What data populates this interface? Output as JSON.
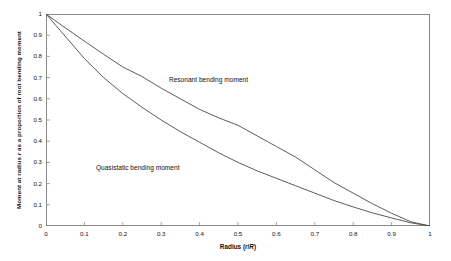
{
  "chart_data": {
    "type": "line",
    "title": "",
    "xlabel": "Radius (r/R)",
    "ylabel": "Moment at radius r as a proportion of root bending moment",
    "xlim": [
      0,
      1
    ],
    "ylim": [
      0,
      1
    ],
    "grid": false,
    "legend_position": "inline-annotations",
    "xticks": [
      "0",
      "0.1",
      "0.2",
      "0.3",
      "0.4",
      "0.5",
      "0.6",
      "0.7",
      "0.8",
      "0.9",
      "1"
    ],
    "yticks": [
      "0",
      "0.1",
      "0.2",
      "0.3",
      "0.4",
      "0.5",
      "0.6",
      "0.7",
      "0.8",
      "0.9",
      "1"
    ],
    "x": [
      0,
      0.05,
      0.1,
      0.15,
      0.2,
      0.25,
      0.3,
      0.35,
      0.4,
      0.45,
      0.5,
      0.55,
      0.6,
      0.65,
      0.7,
      0.75,
      0.8,
      0.85,
      0.9,
      0.95,
      1
    ],
    "series": [
      {
        "name": "Resonant bending moment",
        "values": [
          1.0,
          0.935,
          0.872,
          0.81,
          0.75,
          0.705,
          0.65,
          0.6,
          0.55,
          0.51,
          0.475,
          0.425,
          0.375,
          0.325,
          0.265,
          0.205,
          0.155,
          0.105,
          0.06,
          0.02,
          0.0
        ],
        "annotation": "Resonant bending moment",
        "annotation_x": 0.32,
        "annotation_y": 0.69
      },
      {
        "name": "Quasistatic bending moment",
        "values": [
          1.0,
          0.895,
          0.79,
          0.7,
          0.625,
          0.56,
          0.5,
          0.445,
          0.395,
          0.345,
          0.3,
          0.26,
          0.225,
          0.19,
          0.155,
          0.12,
          0.09,
          0.062,
          0.038,
          0.015,
          0.0
        ],
        "annotation": "Quasistatic bending moment",
        "annotation_x": 0.13,
        "annotation_y": 0.275
      }
    ],
    "colors": {
      "curve": "#4a4a4a",
      "axis": "#8a8a8a",
      "text": "#111111",
      "background": "#ffffff"
    }
  }
}
